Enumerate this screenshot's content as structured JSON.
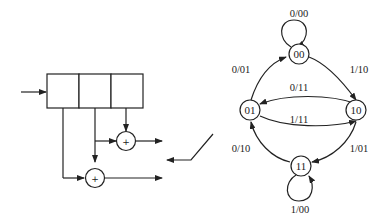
{
  "encoder": {
    "register_cells": 3,
    "adder_symbol": "+"
  },
  "state_diagram": {
    "states": [
      "00",
      "01",
      "10",
      "11"
    ],
    "transitions": [
      {
        "from": "00",
        "to": "00",
        "label": "0/00"
      },
      {
        "from": "01",
        "to": "00",
        "label": "0/01"
      },
      {
        "from": "00",
        "to": "10",
        "label": "1/10"
      },
      {
        "from": "10",
        "to": "01",
        "label": "0/11"
      },
      {
        "from": "01",
        "to": "10",
        "label": "1/11"
      },
      {
        "from": "11",
        "to": "01",
        "label": "0/10"
      },
      {
        "from": "10",
        "to": "11",
        "label": "1/01"
      },
      {
        "from": "11",
        "to": "11",
        "label": "1/00"
      }
    ]
  }
}
